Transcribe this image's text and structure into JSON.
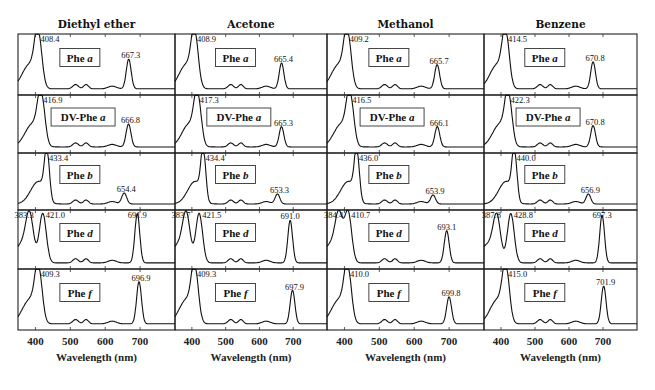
{
  "chart_data": {
    "type": "line",
    "title": "",
    "xlabel": "Wavelength (nm)",
    "ylabel": "",
    "xlim": [
      350,
      800
    ],
    "x_ticks": [
      400,
      500,
      600,
      700
    ],
    "grid": false,
    "legend": "none",
    "columns": [
      {
        "solvent": "Diethyl ether"
      },
      {
        "solvent": "Acetone"
      },
      {
        "solvent": "Methanol"
      },
      {
        "solvent": "Benzene"
      }
    ],
    "rows": [
      {
        "compound": "Phe a",
        "label_base": "Phe",
        "label_italic": "a"
      },
      {
        "compound": "DV-Phe a",
        "label_base": "DV-Phe",
        "label_italic": "a"
      },
      {
        "compound": "Phe b",
        "label_base": "Phe",
        "label_italic": "b"
      },
      {
        "compound": "Phe d",
        "label_base": "Phe",
        "label_italic": "d"
      },
      {
        "compound": "Phe f",
        "label_base": "Phe",
        "label_italic": "f"
      }
    ],
    "panels": [
      [
        {
          "peaks": [
            "408.4",
            "667.3"
          ],
          "soret": 408.4,
          "qy": 667.3,
          "qy_rel": 0.55
        },
        {
          "peaks": [
            "416.9",
            "666.8"
          ],
          "soret": 416.9,
          "qy": 666.8,
          "qy_rel": 0.45
        },
        {
          "peaks": [
            "433.4",
            "654.4"
          ],
          "soret": 433.4,
          "qy": 654.4,
          "qy_rel": 0.22
        },
        {
          "peaks": [
            "383.3",
            "421.0",
            "691.9"
          ],
          "soret2": 383.3,
          "soret": 421.0,
          "qy": 691.9,
          "qy_rel": 0.95
        },
        {
          "peaks": [
            "409.3",
            "696.9"
          ],
          "soret": 409.3,
          "qy": 696.9,
          "qy_rel": 0.78
        }
      ],
      [
        {
          "peaks": [
            "408.9",
            "665.4"
          ],
          "soret": 408.9,
          "qy": 665.4,
          "qy_rel": 0.48
        },
        {
          "peaks": [
            "417.3",
            "665.3"
          ],
          "soret": 417.3,
          "qy": 665.3,
          "qy_rel": 0.4
        },
        {
          "peaks": [
            "434.4",
            "653.3"
          ],
          "soret": 434.4,
          "qy": 653.3,
          "qy_rel": 0.2
        },
        {
          "peaks": [
            "383.7",
            "421.5",
            "691.0"
          ],
          "soret2": 383.7,
          "soret": 421.5,
          "qy": 691.0,
          "qy_rel": 0.82
        },
        {
          "peaks": [
            "409.3",
            "697.9"
          ],
          "soret": 409.3,
          "qy": 697.9,
          "qy_rel": 0.62
        }
      ],
      [
        {
          "peaks": [
            "409.2",
            "665.7"
          ],
          "soret": 409.2,
          "qy": 665.7,
          "qy_rel": 0.45
        },
        {
          "peaks": [
            "416.5",
            "666.1"
          ],
          "soret": 416.5,
          "qy": 666.1,
          "qy_rel": 0.4
        },
        {
          "peaks": [
            "436.0",
            "653.9"
          ],
          "soret": 436.0,
          "qy": 653.9,
          "qy_rel": 0.18
        },
        {
          "peaks": [
            "384.4",
            "410.7",
            "693.1"
          ],
          "soret2": 384.4,
          "soret": 410.7,
          "qy": 693.1,
          "qy_rel": 0.62
        },
        {
          "peaks": [
            "410.0",
            "699.8"
          ],
          "soret": 410.0,
          "qy": 699.8,
          "qy_rel": 0.5
        }
      ],
      [
        {
          "peaks": [
            "414.5",
            "670.8"
          ],
          "soret": 414.5,
          "qy": 670.8,
          "qy_rel": 0.5
        },
        {
          "peaks": [
            "422.3",
            "670.8"
          ],
          "soret": 422.3,
          "qy": 670.8,
          "qy_rel": 0.42
        },
        {
          "peaks": [
            "440.0",
            "656.9"
          ],
          "soret": 440.0,
          "qy": 656.9,
          "qy_rel": 0.2
        },
        {
          "peaks": [
            "387.8",
            "428.8",
            "697.3"
          ],
          "soret2": 387.8,
          "soret": 428.8,
          "qy": 697.3,
          "qy_rel": 0.92
        },
        {
          "peaks": [
            "415.0",
            "701.9"
          ],
          "soret": 415.0,
          "qy": 701.9,
          "qy_rel": 0.7
        }
      ]
    ]
  },
  "columns": [
    {
      "title": "Diethyl ether"
    },
    {
      "title": "Acetone"
    },
    {
      "title": "Methanol"
    },
    {
      "title": "Benzene"
    }
  ],
  "x_tick_labels": [
    "400",
    "500",
    "600",
    "700"
  ],
  "x_axis_title": "Wavelength (nm)"
}
